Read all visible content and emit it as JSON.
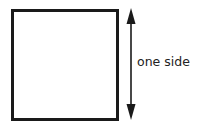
{
  "diagram": {
    "shape": "square",
    "dimension_label": "one side",
    "arrow": "double-headed-vertical",
    "colors": {
      "stroke": "#1a1a1a",
      "text": "#222222",
      "background": "#ffffff"
    }
  }
}
